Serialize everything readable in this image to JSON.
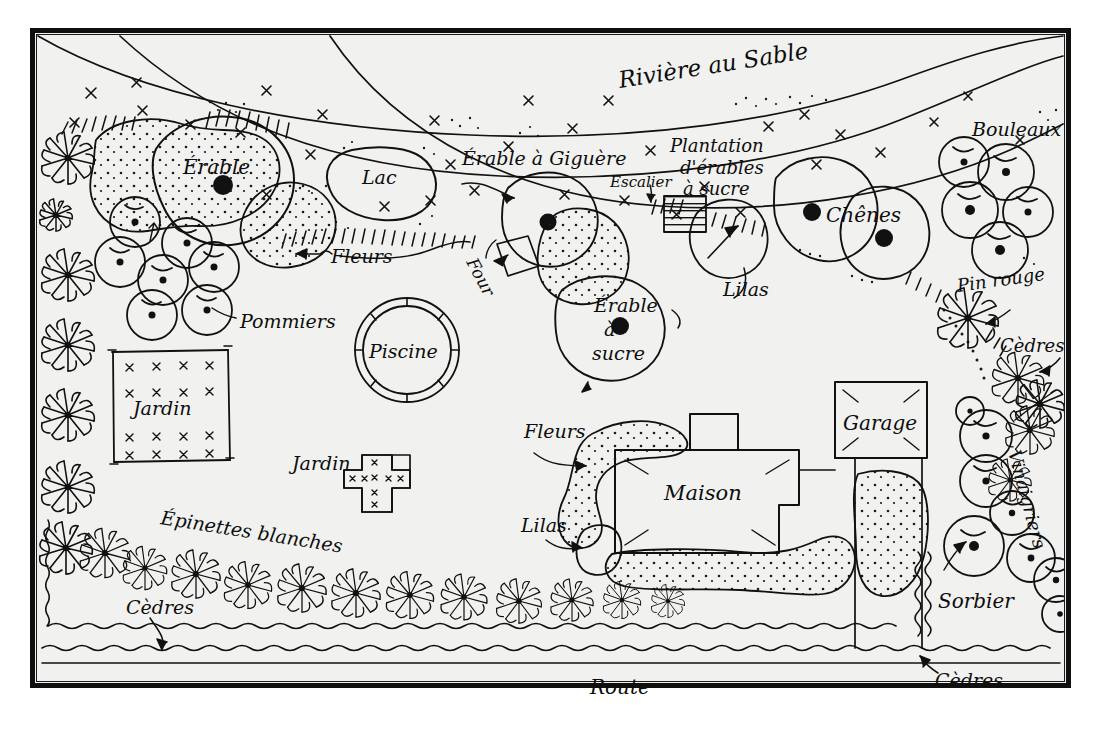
{
  "map": {
    "title": "Plan de propriete dessine a la main",
    "type": "hand-drawn-property-site-plan",
    "background_color": "#f1f1ef",
    "ink_color": "#0d0d0d",
    "frame": {
      "outer_border_color": "#101010",
      "inner_border_color": "#1a1a1a"
    }
  },
  "labels": {
    "riviere": "Rivière au Sable",
    "lac": "Lac",
    "erable": "Érable",
    "fleurs_haut": "Fleurs",
    "pommiers": "Pommiers",
    "jardin_carre": "Jardin",
    "jardin_croix": "Jardin",
    "piscine": "Piscine",
    "epinettes": "Épinettes blanches",
    "cedres_gauche": "Cèdres",
    "erable_giguere": "Érable à Giguère",
    "four": "Four",
    "escalier": "Escalier",
    "erable_sucre_l1": "Érable",
    "erable_sucre_l2": "à",
    "erable_sucre_l3": "sucre",
    "plantation_l1": "Plantation",
    "plantation_l2": "d'érables",
    "plantation_l3": "à sucre",
    "lilas_haut": "Lilas",
    "chenes": "Chênes",
    "bouleaux": "Bouleaux",
    "pin_rouge": "Pin rouge",
    "cedres_droite": "Cèdres",
    "vinaigriers": "Vinaigriers",
    "sorbier": "Sorbier",
    "cedres_bas_droite": "Cèdres",
    "fleurs_maison": "Fleurs",
    "lilas_maison": "Lilas",
    "maison": "Maison",
    "garage": "Garage",
    "route": "Route"
  }
}
